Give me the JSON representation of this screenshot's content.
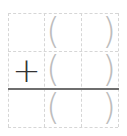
{
  "worksheet": {
    "type": "vertical-addition",
    "operator": "+",
    "rows": [
      {
        "operator": "",
        "cells": [
          {
            "open": "(",
            "close": ")"
          }
        ]
      },
      {
        "operator": "+",
        "cells": [
          {
            "open": "(",
            "close": ")"
          }
        ]
      },
      {
        "operator": "",
        "cells": [
          {
            "open": "(",
            "close": ")"
          }
        ]
      }
    ],
    "colors": {
      "grid": "#d6d6d6",
      "rule": "#6e6e6e",
      "paren": "#bdbdbd",
      "operator": "#333333"
    }
  }
}
